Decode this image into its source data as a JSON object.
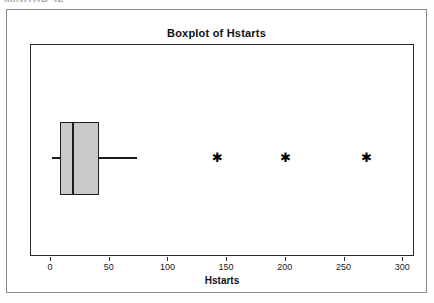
{
  "page": {
    "clipped_top_text": "MINITAB 42",
    "background_color": "#ffffff"
  },
  "figure": {
    "title": "Boxplot of Hstarts",
    "border_color": "#8a8a8a",
    "plot_frame_color": "#2b2b2b",
    "box_fill_color": "#c9c9c9",
    "line_color": "#1c1c1c"
  },
  "axis": {
    "x_title": "Hstarts",
    "ticks": [
      {
        "label": "0",
        "value": 0
      },
      {
        "label": "50",
        "value": 50
      },
      {
        "label": "100",
        "value": 100
      },
      {
        "label": "150",
        "value": 150
      },
      {
        "label": "200",
        "value": 200
      },
      {
        "label": "250",
        "value": 250
      },
      {
        "label": "300",
        "value": 300
      }
    ]
  },
  "chart_data": {
    "type": "box",
    "title": "Boxplot of Hstarts",
    "xlabel": "Hstarts",
    "ylabel": "",
    "orientation": "horizontal",
    "xlim": [
      -17,
      310
    ],
    "grid": false,
    "legend": null,
    "categories": [
      "Hstarts"
    ],
    "series": [
      {
        "name": "Hstarts",
        "min_whisker": 1,
        "q1": 8,
        "median": 18,
        "q3": 41,
        "max_whisker": 73,
        "outliers": [
          141,
          199,
          268
        ]
      }
    ]
  }
}
